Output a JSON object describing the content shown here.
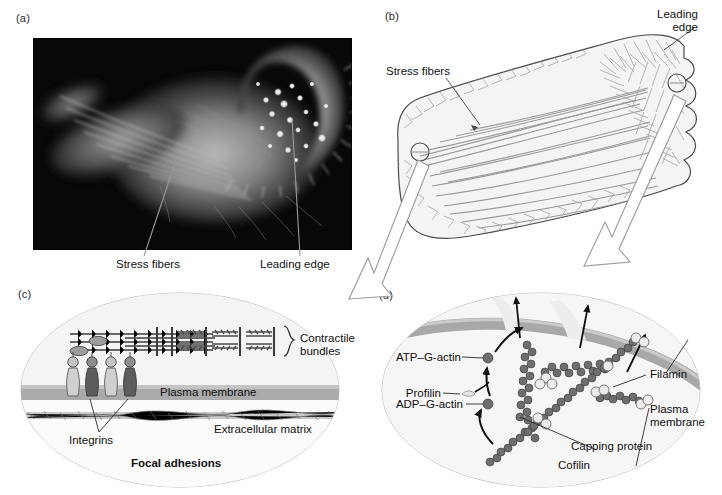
{
  "figure": {
    "panels": [
      {
        "id": "a",
        "tag": "(a)",
        "kind": "micrograph",
        "labels": [
          {
            "name": "stress-fibers",
            "text": "Stress fibers"
          },
          {
            "name": "leading-edge",
            "text": "Leading edge"
          }
        ]
      },
      {
        "id": "b",
        "tag": "(b)",
        "kind": "line-drawing",
        "labels": [
          {
            "name": "stress-fibers",
            "text": "Stress fibers"
          },
          {
            "name": "leading-edge",
            "text": "Leading\nedge"
          }
        ]
      },
      {
        "id": "c",
        "tag": "(c)",
        "kind": "inset-detail",
        "title": "Focal adhesions",
        "labels": [
          {
            "name": "contractile-bundles",
            "text": "Contractile\nbundles"
          },
          {
            "name": "plasma-membrane",
            "text": "Plasma membrane"
          },
          {
            "name": "extracellular-matrix",
            "text": "Extracellular matrix"
          },
          {
            "name": "integrins",
            "text": "Integrins"
          }
        ]
      },
      {
        "id": "d",
        "tag": "(d)",
        "kind": "inset-detail",
        "labels": [
          {
            "name": "atp-g-actin",
            "text": "ATP–G-actin"
          },
          {
            "name": "profilin",
            "text": "Profilin"
          },
          {
            "name": "adp-g-actin",
            "text": "ADP–G-actin"
          },
          {
            "name": "filamin",
            "text": "Filamin"
          },
          {
            "name": "plasma-membrane",
            "text": "Plasma\nmembrane"
          },
          {
            "name": "capping-protein",
            "text": "Capping protein"
          },
          {
            "name": "cofilin",
            "text": "Cofilin"
          }
        ]
      }
    ],
    "colors": {
      "ink": "#1a1a1a",
      "line": "#8a8a8a",
      "line_dark": "#5d5d5d",
      "membrane": "#a9a9a9",
      "cytoplasm": "#f2f2f2",
      "actin_dark": "#6b6b6b",
      "actin_light": "#d8d8d8",
      "integrin_light": "#c9c9c9",
      "integrin_dark": "#5a5a5a",
      "photo_bg": "#0a0a0a",
      "photo_glow": "#d9d9d9"
    }
  }
}
